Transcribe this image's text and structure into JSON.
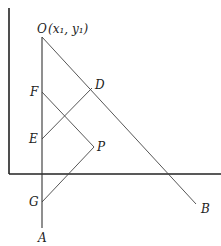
{
  "figure": {
    "points": {
      "O": "O",
      "O_coord": "(x₁, y₁)",
      "D": "D",
      "F": "F",
      "E": "E",
      "P": "P",
      "G": "G",
      "A": "A",
      "B": "B"
    },
    "segments": [
      "OA",
      "OB",
      "FP",
      "ED",
      "GP"
    ],
    "axes": [
      "x-axis",
      "y-axis"
    ]
  }
}
